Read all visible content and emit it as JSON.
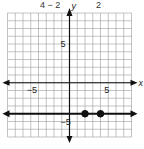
{
  "header": {
    "left_text": "4 − 2",
    "right_text": "2"
  },
  "chart_data": {
    "type": "line",
    "title": "",
    "xlabel": "x",
    "ylabel": "y",
    "xlim": [
      -8,
      8
    ],
    "ylim": [
      -7,
      9
    ],
    "grid": true,
    "tick_labels": {
      "x": [
        "−5",
        "5"
      ],
      "y": [
        "5",
        "−5"
      ]
    },
    "tick_values": {
      "x": [
        -5,
        5
      ],
      "y": [
        5,
        -5
      ]
    },
    "series": [
      {
        "name": "horizontal line",
        "y": -4,
        "arrows": "both"
      }
    ],
    "points": [
      {
        "x": 2,
        "y": -4,
        "filled": true
      },
      {
        "x": 4,
        "y": -4,
        "filled": true
      }
    ]
  }
}
